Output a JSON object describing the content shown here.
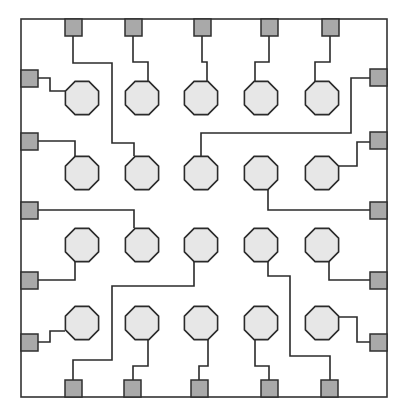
{
  "diagram": {
    "title": "",
    "type": "chip-package-bond-diagram",
    "colors": {
      "frame": "#333333",
      "wire": "#2b2b2b",
      "pad_fill": "#a9a9a9",
      "die_fill": "#e7e7e7"
    },
    "frame": {
      "x": 21,
      "y": 19,
      "w": 366,
      "h": 378
    },
    "grid": {
      "columns_x": [
        82,
        142,
        201,
        261,
        322
      ],
      "rows_y": [
        98,
        173,
        245,
        323
      ],
      "die_radius": 18
    },
    "pads": {
      "top": [
        {
          "x": 64,
          "y": 19
        },
        {
          "x": 125,
          "y": 19
        },
        {
          "x": 193,
          "y": 19
        },
        {
          "x": 261,
          "y": 19
        },
        {
          "x": 321,
          "y": 19
        }
      ],
      "left": [
        {
          "x": 21,
          "y": 70
        },
        {
          "x": 21,
          "y": 133
        },
        {
          "x": 21,
          "y": 202
        },
        {
          "x": 21,
          "y": 272
        },
        {
          "x": 21,
          "y": 334
        }
      ],
      "right": [
        {
          "x": 370,
          "y": 69
        },
        {
          "x": 370,
          "y": 132
        },
        {
          "x": 370,
          "y": 202
        },
        {
          "x": 370,
          "y": 272
        },
        {
          "x": 370,
          "y": 334
        }
      ],
      "bottom": [
        {
          "x": 65,
          "y": 380
        },
        {
          "x": 124,
          "y": 380
        },
        {
          "x": 191,
          "y": 380
        },
        {
          "x": 261,
          "y": 380
        },
        {
          "x": 321,
          "y": 380
        }
      ],
      "size": 17
    },
    "node_count": 20,
    "pad_count": 20
  }
}
